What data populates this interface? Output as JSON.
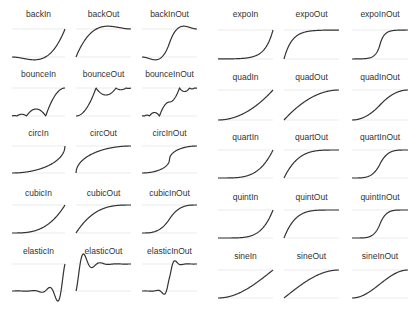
{
  "chart_data": {
    "type": "line",
    "title": "",
    "style": {
      "line_color": "#333333",
      "grid_color": "#e6e6e6",
      "label_color": "#333333",
      "background": "#ffffff"
    },
    "grid": true,
    "x_range": [
      0,
      1
    ],
    "y_range": [
      0,
      1
    ],
    "panels": [
      {
        "name": "backIn",
        "fn": "backIn",
        "half": "left",
        "row": 0,
        "col": 0
      },
      {
        "name": "backOut",
        "fn": "backOut",
        "half": "left",
        "row": 0,
        "col": 1
      },
      {
        "name": "backInOut",
        "fn": "backInOut",
        "half": "left",
        "row": 0,
        "col": 2
      },
      {
        "name": "bounceIn",
        "fn": "bounceIn",
        "half": "left",
        "row": 1,
        "col": 0
      },
      {
        "name": "bounceOut",
        "fn": "bounceOut",
        "half": "left",
        "row": 1,
        "col": 1
      },
      {
        "name": "bounceInOut",
        "fn": "bounceInOut",
        "half": "left",
        "row": 1,
        "col": 2
      },
      {
        "name": "circIn",
        "fn": "circIn",
        "half": "left",
        "row": 2,
        "col": 0
      },
      {
        "name": "circOut",
        "fn": "circOut",
        "half": "left",
        "row": 2,
        "col": 1
      },
      {
        "name": "circInOut",
        "fn": "circInOut",
        "half": "left",
        "row": 2,
        "col": 2
      },
      {
        "name": "cubicIn",
        "fn": "cubicIn",
        "half": "left",
        "row": 3,
        "col": 0
      },
      {
        "name": "cubicOut",
        "fn": "cubicOut",
        "half": "left",
        "row": 3,
        "col": 1
      },
      {
        "name": "cubicInOut",
        "fn": "cubicInOut",
        "half": "left",
        "row": 3,
        "col": 2
      },
      {
        "name": "elasticIn",
        "fn": "elasticIn",
        "half": "left",
        "row": 4,
        "col": 0
      },
      {
        "name": "elasticOut",
        "fn": "elasticOut",
        "half": "left",
        "row": 4,
        "col": 1
      },
      {
        "name": "elasticInOut",
        "fn": "elasticInOut",
        "half": "left",
        "row": 4,
        "col": 2
      },
      {
        "name": "expoIn",
        "fn": "expoIn",
        "half": "right",
        "row": 0,
        "col": 0
      },
      {
        "name": "expoOut",
        "fn": "expoOut",
        "half": "right",
        "row": 0,
        "col": 1
      },
      {
        "name": "expoInOut",
        "fn": "expoInOut",
        "half": "right",
        "row": 0,
        "col": 2
      },
      {
        "name": "quadIn",
        "fn": "quadIn",
        "half": "right",
        "row": 1,
        "col": 0
      },
      {
        "name": "quadOut",
        "fn": "quadOut",
        "half": "right",
        "row": 1,
        "col": 1
      },
      {
        "name": "quadInOut",
        "fn": "quadInOut",
        "half": "right",
        "row": 1,
        "col": 2
      },
      {
        "name": "quartIn",
        "fn": "quartIn",
        "half": "right",
        "row": 2,
        "col": 0
      },
      {
        "name": "quartOut",
        "fn": "quartOut",
        "half": "right",
        "row": 2,
        "col": 1
      },
      {
        "name": "quartInOut",
        "fn": "quartInOut",
        "half": "right",
        "row": 2,
        "col": 2
      },
      {
        "name": "quintIn",
        "fn": "quintIn",
        "half": "right",
        "row": 3,
        "col": 0
      },
      {
        "name": "quintOut",
        "fn": "quintOut",
        "half": "right",
        "row": 3,
        "col": 1
      },
      {
        "name": "quintInOut",
        "fn": "quintInOut",
        "half": "right",
        "row": 3,
        "col": 2
      },
      {
        "name": "sineIn",
        "fn": "sineIn",
        "half": "right",
        "row": 4,
        "col": 0
      },
      {
        "name": "sineOut",
        "fn": "sineOut",
        "half": "right",
        "row": 4,
        "col": 1
      },
      {
        "name": "sineInOut",
        "fn": "sineInOut",
        "half": "right",
        "row": 4,
        "col": 2
      }
    ],
    "layout": {
      "left": {
        "col_x": [
          [
            12,
            65
          ],
          [
            76,
            131
          ],
          [
            142,
            197
          ]
        ],
        "rows": [
          {
            "label_y": 15,
            "top": 29,
            "bottom": 57
          },
          {
            "label_y": 75,
            "top": 88,
            "bottom": 116
          },
          {
            "label_y": 134,
            "top": 146,
            "bottom": 173
          },
          {
            "label_y": 194,
            "top": 205,
            "bottom": 233
          },
          {
            "label_y": 252,
            "top": 264,
            "bottom": 291
          }
        ]
      },
      "right": {
        "col_x": [
          [
            218,
            273
          ],
          [
            284,
            339
          ],
          [
            352,
            408
          ]
        ],
        "rows": [
          {
            "label_y": 15,
            "top": 30,
            "bottom": 59
          },
          {
            "label_y": 78,
            "top": 90,
            "bottom": 120
          },
          {
            "label_y": 138,
            "top": 150,
            "bottom": 178
          },
          {
            "label_y": 198,
            "top": 210,
            "bottom": 238
          },
          {
            "label_y": 257,
            "top": 270,
            "bottom": 298
          }
        ]
      }
    }
  }
}
